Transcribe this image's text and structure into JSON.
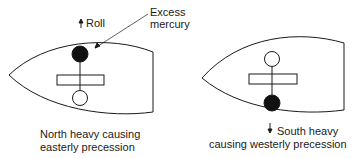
{
  "labels": {
    "roll": "Roll",
    "excess_line1": "Excess",
    "excess_line2": "mercury",
    "north_line1": "North heavy causing",
    "north_line2": "easterly precession",
    "south_line1": "South heavy",
    "south_line2": "causing westerly precession"
  },
  "icons": {
    "roll_arrow": "arrow-up",
    "south_arrow": "arrow-down"
  },
  "colors": {
    "stroke": "#1a1a1a",
    "fill_heavy": "#111111",
    "background": "#ffffff"
  }
}
